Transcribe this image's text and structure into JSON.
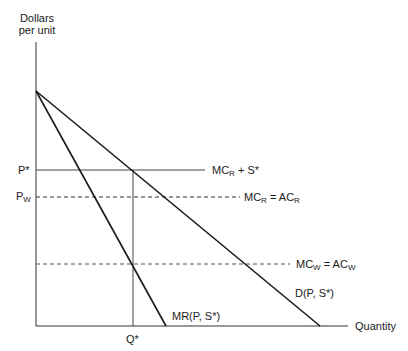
{
  "axes": {
    "y_label_line1": "Dollars",
    "y_label_line2": "per unit",
    "x_label": "Quantity"
  },
  "prices": {
    "p_star": "P*",
    "p_w": "P",
    "p_w_sub": "W"
  },
  "quantity": {
    "q_star": "Q*"
  },
  "curves": {
    "mc_r_plus_s": {
      "pre": "MC",
      "sub": "R",
      "post": " + S*"
    },
    "mc_r_ac_r": {
      "pre": "MC",
      "sub1": "R",
      "mid": " = AC",
      "sub2": "R"
    },
    "mc_w_ac_w": {
      "pre": "MC",
      "sub1": "W",
      "mid": " = AC",
      "sub2": "W"
    },
    "demand": "D(P, S*)",
    "marginal_revenue": "MR(P, S*)"
  },
  "colors": {
    "line": "#1a1a1a",
    "guide": "#555555"
  }
}
